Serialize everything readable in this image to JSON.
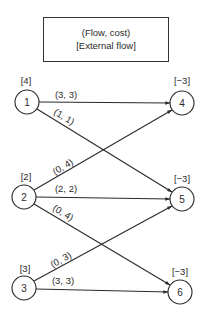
{
  "legend": {
    "line1": "(Flow, cost)",
    "line2": "[External flow]"
  },
  "nodes": [
    {
      "id": "1",
      "label": "1",
      "external_flow": "[4]",
      "x": 27,
      "y": 102
    },
    {
      "id": "2",
      "label": "2",
      "external_flow": "[2]",
      "x": 24,
      "y": 197
    },
    {
      "id": "3",
      "label": "3",
      "external_flow": "[3]",
      "x": 24,
      "y": 288
    },
    {
      "id": "4",
      "label": "4",
      "external_flow": "[−3]",
      "x": 182,
      "y": 103
    },
    {
      "id": "5",
      "label": "5",
      "external_flow": "[−3]",
      "x": 182,
      "y": 199
    },
    {
      "id": "6",
      "label": "6",
      "external_flow": "[−3]",
      "x": 180,
      "y": 292
    }
  ],
  "edges": [
    {
      "from": "1",
      "to": "4",
      "label": "(3, 3)",
      "flow": 3,
      "cost": 3
    },
    {
      "from": "1",
      "to": "5",
      "label": "(1, 1)",
      "flow": 1,
      "cost": 1
    },
    {
      "from": "2",
      "to": "4",
      "label": "(0, 4)",
      "flow": 0,
      "cost": 4
    },
    {
      "from": "2",
      "to": "5",
      "label": "(2, 2)",
      "flow": 2,
      "cost": 2
    },
    {
      "from": "2",
      "to": "6",
      "label": "(0, 4)",
      "flow": 0,
      "cost": 4
    },
    {
      "from": "3",
      "to": "5",
      "label": "(0, 3)",
      "flow": 0,
      "cost": 3
    },
    {
      "from": "3",
      "to": "6",
      "label": "(3, 3)",
      "flow": 3,
      "cost": 3
    }
  ],
  "colors": {
    "stroke": "#2a2a2a",
    "background": "#ffffff"
  }
}
